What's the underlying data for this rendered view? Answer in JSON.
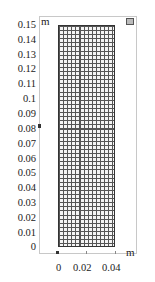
{
  "plot": {
    "y_unit": "m",
    "x_unit": "m",
    "y_ticks": [
      "0.15",
      "0.14",
      "0.13",
      "0.12",
      "0.11",
      "0.1",
      "0.09",
      "0.08",
      "0.07",
      "0.06",
      "0.05",
      "0.04",
      "0.03",
      "0.02",
      "0.01",
      "0"
    ],
    "x_ticks": [
      "0",
      "0.02",
      "0.04"
    ]
  },
  "mesh": {
    "type": "mapped quadrilateral mesh",
    "x_range": [
      0,
      0.04
    ],
    "y_range": [
      0,
      0.15
    ],
    "edge_color": "#333333"
  }
}
